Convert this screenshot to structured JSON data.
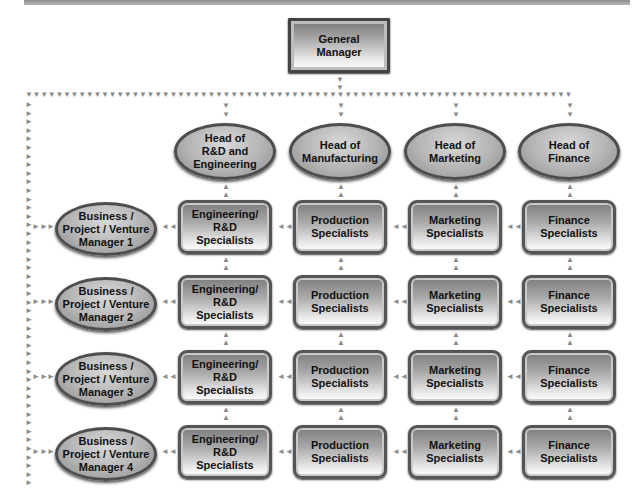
{
  "diagram": {
    "general_manager": "General Manager",
    "heads": [
      {
        "label": "Head of R&D and Engineering",
        "lines": [
          "Head of",
          "R&D and",
          "Engineering"
        ]
      },
      {
        "label": "Head of Manufacturing",
        "lines": [
          "Head of",
          "Manufacturing"
        ]
      },
      {
        "label": "Head of Marketing",
        "lines": [
          "Head of",
          "Marketing"
        ]
      },
      {
        "label": "Head of Finance",
        "lines": [
          "Head of",
          "Finance"
        ]
      }
    ],
    "managers": [
      {
        "lines": [
          "Business /",
          "Project / Venture",
          "Manager 1"
        ]
      },
      {
        "lines": [
          "Business /",
          "Project / Venture",
          "Manager 2"
        ]
      },
      {
        "lines": [
          "Business /",
          "Project / Venture",
          "Manager 3"
        ]
      },
      {
        "lines": [
          "Business /",
          "Project / Venture",
          "Manager 4"
        ]
      }
    ],
    "specialists": [
      {
        "lines": [
          "Engineering/",
          "R&D",
          "Specialists"
        ]
      },
      {
        "lines": [
          "Production",
          "Specialists"
        ]
      },
      {
        "lines": [
          "Marketing",
          "Specialists"
        ]
      },
      {
        "lines": [
          "Finance",
          "Specialists"
        ]
      }
    ],
    "arrow_glyphs": {
      "down": "▼",
      "up": "▲",
      "left": "◄",
      "right": "►"
    },
    "colors": {
      "border": "#4d4d4d",
      "fill_dark": "#7d7d7d",
      "fill_light": "#ffffff",
      "connector": "#9a9a9a"
    }
  }
}
